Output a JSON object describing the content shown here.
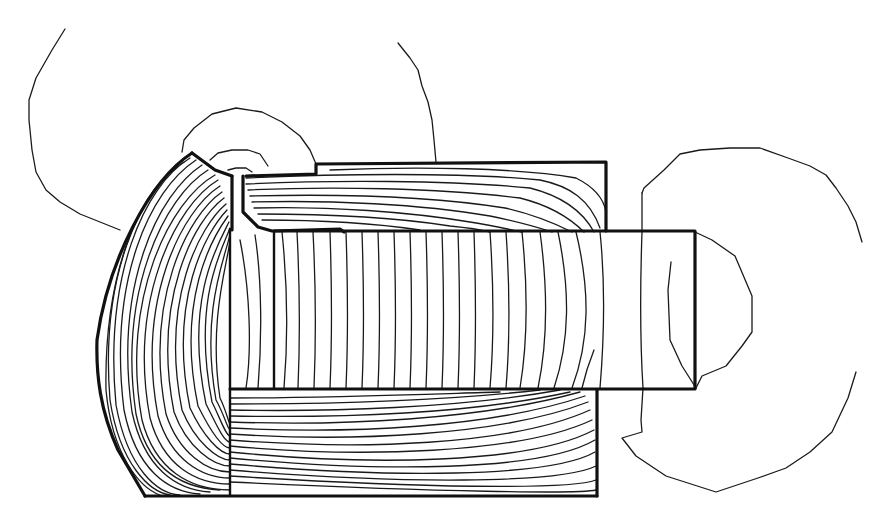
{
  "diagram": {
    "style": {
      "line_color": "#111111",
      "background": "#ffffff"
    },
    "components": [
      {
        "name": "outer-housing",
        "description": "Curved-face core housing with thick outline"
      },
      {
        "name": "upper-yoke",
        "description": "Upper rectangular yoke section"
      },
      {
        "name": "lower-yoke",
        "description": "Lower rectangular yoke section"
      },
      {
        "name": "plunger",
        "description": "Horizontal cylindrical plunger extending to the right"
      },
      {
        "name": "air-gap-notch",
        "description": "Narrow vertical slot near top-left of plunger"
      },
      {
        "name": "flux-lines-core",
        "description": "Dense concentric flux contours inside the core"
      },
      {
        "name": "flux-lines-plunger",
        "description": "Near-vertical flux contours across the plunger"
      },
      {
        "name": "leakage-field-loops",
        "description": "Sparse outer leakage field loops around the structure"
      }
    ],
    "text_labels": []
  }
}
